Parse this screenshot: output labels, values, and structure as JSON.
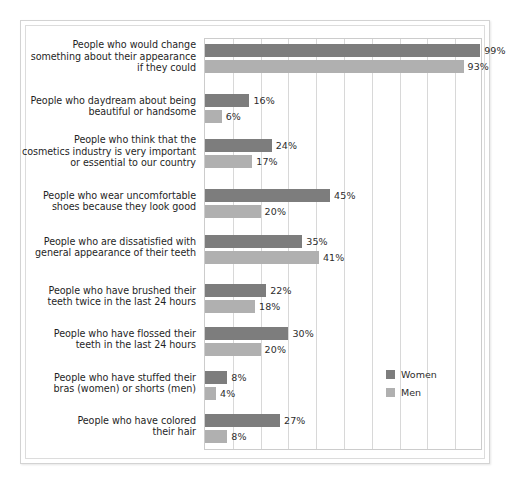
{
  "chart_data": {
    "type": "bar",
    "orientation": "horizontal",
    "title": "",
    "subtitle": "",
    "xlabel": "",
    "ylabel": "",
    "xlim": [
      0,
      100
    ],
    "xtick_labels": [],
    "grid": true,
    "legend_position": "inside-right",
    "categories": [
      "People who would change something about their appearance if they could",
      "People who daydream about being beautiful or handsome",
      "People who think that the cosmetics industry is very important or essential to our country",
      "People who wear uncomfortable shoes because they look good",
      "People who are dissatisfied with general appearance of their teeth",
      "People who have brushed their teeth twice in the last 24 hours",
      "People who have flossed their teeth in the last 24 hours",
      "People who have stuffed their bras (women) or shorts (men)",
      "People who have colored their hair"
    ],
    "category_lines": [
      [
        "People who would change",
        "something about their appearance",
        "if they could"
      ],
      [
        "People who daydream about being",
        "beautiful or handsome"
      ],
      [
        "People who think that the",
        "cosmetics industry is very important",
        "or essential to our country"
      ],
      [
        "People who wear uncomfortable",
        "shoes because they look good"
      ],
      [
        "People who are dissatisfied with",
        "general appearance of their teeth"
      ],
      [
        "People who have brushed their",
        "teeth twice in the last 24 hours"
      ],
      [
        "People who have flossed their",
        "teeth in the last 24 hours"
      ],
      [
        "People who have stuffed their",
        "bras (women) or shorts (men)"
      ],
      [
        "People who have colored",
        "their hair"
      ]
    ],
    "series": [
      {
        "name": "Women",
        "color": "#7d7d7d",
        "values": [
          99,
          16,
          24,
          45,
          35,
          22,
          30,
          8,
          27
        ],
        "value_labels": [
          "99%",
          "16%",
          "24%",
          "45%",
          "35%",
          "22%",
          "30%",
          "8%",
          "27%"
        ]
      },
      {
        "name": "Men",
        "color": "#b0b0b0",
        "values": [
          93,
          6,
          17,
          20,
          41,
          18,
          20,
          4,
          8
        ],
        "value_labels": [
          "93%",
          "6%",
          "17%",
          "20%",
          "41%",
          "18%",
          "20%",
          "4%",
          "8%"
        ]
      }
    ]
  },
  "legend": {
    "entries": [
      {
        "label": "Women",
        "color": "#7d7d7d"
      },
      {
        "label": "Men",
        "color": "#b0b0b0"
      }
    ]
  }
}
